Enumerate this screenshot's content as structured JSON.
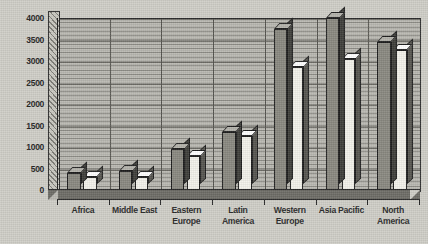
{
  "chart_data": {
    "type": "bar",
    "title": "",
    "subtitle": "",
    "xlabel": "",
    "ylabel": "(Millions)",
    "ylim": [
      0,
      4000
    ],
    "ytick_labels": [
      "0",
      "500",
      "1000",
      "1500",
      "2000",
      "2500",
      "3000",
      "3500",
      "4000"
    ],
    "ytick_values": [
      0,
      500,
      1000,
      1500,
      2000,
      2500,
      3000,
      3500,
      4000
    ],
    "grid": true,
    "grid_orientation": "horizontal",
    "legend": false,
    "legend_position": "none",
    "style": "3d-grouped-bar-grayscale",
    "categories": [
      "Africa",
      "Middle East",
      "Eastern Europe",
      "Latin America",
      "Western Europe",
      "Asia Pacific",
      "North America"
    ],
    "category_label_lines": [
      [
        "Africa"
      ],
      [
        "Middle East"
      ],
      [
        "Eastern",
        "Europe"
      ],
      [
        "Latin",
        "America"
      ],
      [
        "Western",
        "Europe"
      ],
      [
        "Asia Pacific"
      ],
      [
        "North",
        "America"
      ]
    ],
    "series": [
      {
        "name": "Series 1",
        "color": "#898880",
        "values": [
          400,
          450,
          950,
          1350,
          3750,
          4000,
          3450
        ]
      },
      {
        "name": "Series 2",
        "color": "#f2f1ea",
        "values": [
          300,
          300,
          800,
          1250,
          2850,
          3050,
          3250
        ]
      }
    ],
    "colors": {
      "series_1_face": "#898880",
      "series_1_top": "#b3b2ab",
      "series_1_side": "#3e3e3a",
      "series_2_face": "#f2f1ea",
      "series_2_top": "#ffffff",
      "series_2_side": "#56554f",
      "plot_background": "#b9b8b1",
      "page_background": "#cfcec7",
      "gridline": "#8e8d87",
      "axis": "#222222",
      "text": "#2a2a2a"
    }
  }
}
